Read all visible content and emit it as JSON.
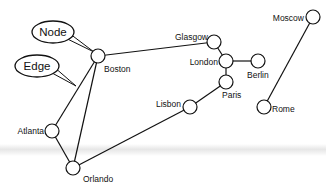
{
  "diagram": {
    "type": "graph",
    "callouts": [
      {
        "id": "node",
        "text": "Node",
        "cx": 53,
        "cy": 32,
        "rx": 21,
        "ry": 11,
        "pointer_to": [
          94,
          52
        ]
      },
      {
        "id": "edge",
        "text": "Edge",
        "cx": 37,
        "cy": 66,
        "rx": 22,
        "ry": 11,
        "pointer_to": [
          76,
          86
        ]
      }
    ],
    "nodes": [
      {
        "id": "boston",
        "label": "Boston",
        "x": 98,
        "y": 56,
        "lx": 104,
        "ly": 72,
        "anchor": "start"
      },
      {
        "id": "glasgow",
        "label": "Glasgow",
        "x": 214,
        "y": 42,
        "lx": 208,
        "ly": 40,
        "anchor": "end"
      },
      {
        "id": "london",
        "label": "London",
        "x": 226,
        "y": 61,
        "lx": 218,
        "ly": 65,
        "anchor": "end"
      },
      {
        "id": "berlin",
        "label": "Berlin",
        "x": 258,
        "y": 61,
        "lx": 247,
        "ly": 78,
        "anchor": "start"
      },
      {
        "id": "paris",
        "label": "Paris",
        "x": 226,
        "y": 82,
        "lx": 222,
        "ly": 98,
        "anchor": "start"
      },
      {
        "id": "lisbon",
        "label": "Lisbon",
        "x": 190,
        "y": 107,
        "lx": 181,
        "ly": 107,
        "anchor": "end"
      },
      {
        "id": "moscow",
        "label": "Moscow",
        "x": 313,
        "y": 17,
        "lx": 304,
        "ly": 21,
        "anchor": "end"
      },
      {
        "id": "rome",
        "label": "Rome",
        "x": 264,
        "y": 107,
        "lx": 272,
        "ly": 112,
        "anchor": "start"
      },
      {
        "id": "atlanta",
        "label": "Atlanta",
        "x": 52,
        "y": 131,
        "lx": 44,
        "ly": 134,
        "anchor": "end"
      },
      {
        "id": "orlando",
        "label": "Orlando",
        "x": 73,
        "y": 168,
        "lx": 83,
        "ly": 182,
        "anchor": "start"
      }
    ],
    "edges": [
      [
        "boston",
        "glasgow"
      ],
      [
        "boston",
        "atlanta"
      ],
      [
        "boston",
        "orlando"
      ],
      [
        "atlanta",
        "orlando"
      ],
      [
        "orlando",
        "lisbon"
      ],
      [
        "lisbon",
        "paris"
      ],
      [
        "paris",
        "london"
      ],
      [
        "london",
        "glasgow"
      ],
      [
        "london",
        "berlin"
      ],
      [
        "moscow",
        "rome"
      ]
    ],
    "node_radius": 7,
    "colors": {
      "stroke": "#111111",
      "fill": "#ffffff"
    }
  }
}
